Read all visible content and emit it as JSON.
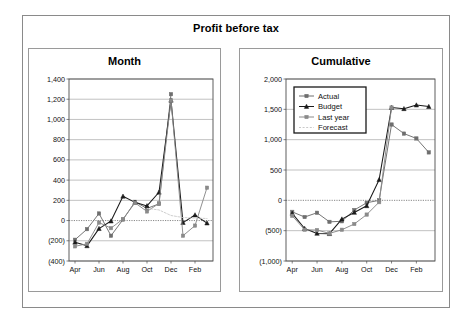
{
  "document": {
    "title": "Profit before tax"
  },
  "colors": {
    "page_background": "#ffffff",
    "frame_border": "#8a8a8a",
    "panel_border": "#9a9a9a",
    "plot_border": "#4d4d4d",
    "gridline": "#a8a8a8",
    "zero_line": "#7a7a7a",
    "actual": "#6e6e6e",
    "budget": "#1a1a1a",
    "last_year": "#8a8a8a",
    "forecast": "#c9c9c9",
    "legend_background": "#ffffff",
    "legend_border": "#1a1a1a",
    "text": "#111111"
  },
  "charts": [
    {
      "id": "month",
      "title": "Month",
      "axis": {
        "ylim": [
          -400,
          1400
        ],
        "ystep": 200,
        "yticks": [
          "1,400",
          "1,200",
          "1,000",
          "800",
          "600",
          "400",
          "200",
          "0",
          "(200)",
          "(400)"
        ],
        "ytick_values": [
          1400,
          1200,
          1000,
          800,
          600,
          400,
          200,
          0,
          -200,
          -400
        ],
        "xticks": [
          "Apr",
          "Jun",
          "Aug",
          "Oct",
          "Dec",
          "Feb"
        ],
        "xtick_indices": [
          0,
          2,
          4,
          6,
          8,
          10
        ]
      }
    },
    {
      "id": "cumulative",
      "title": "Cumulative",
      "axis": {
        "ylim": [
          -1000,
          2000
        ],
        "ystep": 500,
        "yticks": [
          "2,000",
          "1,500",
          "1,000",
          "500",
          "0",
          "(500)",
          "(1,000)"
        ],
        "ytick_values": [
          2000,
          1500,
          1000,
          500,
          0,
          -500,
          -1000
        ],
        "xticks": [
          "Apr",
          "Jun",
          "Aug",
          "Oct",
          "Dec",
          "Feb"
        ],
        "xtick_indices": [
          0,
          2,
          4,
          6,
          8,
          10
        ]
      }
    }
  ],
  "legend": {
    "position": "top-left-inside-cumulative",
    "items": [
      {
        "label": "Actual",
        "marker": "square",
        "color": "#6e6e6e"
      },
      {
        "label": "Budget",
        "marker": "triangle",
        "color": "#1a1a1a"
      },
      {
        "label": "Last year",
        "marker": "square",
        "color": "#8a8a8a"
      },
      {
        "label": "Forecast",
        "marker": "none",
        "color": "#c9c9c9"
      }
    ]
  },
  "chart_data": [
    {
      "type": "line",
      "id": "month",
      "title": "Month",
      "xlabel": "",
      "ylabel": "",
      "ylim": [
        -400,
        1400
      ],
      "grid": true,
      "categories": [
        "Apr",
        "May",
        "Jun",
        "Jul",
        "Aug",
        "Sep",
        "Oct",
        "Nov",
        "Dec",
        "Jan",
        "Feb",
        "Mar"
      ],
      "tick_labels": [
        "Apr",
        "Jun",
        "Aug",
        "Oct",
        "Dec",
        "Feb"
      ],
      "legend_position": "none",
      "series": [
        {
          "name": "Actual",
          "values": [
            -190,
            -85,
            70,
            -150,
            10,
            185,
            120,
            165,
            1250,
            null,
            null,
            null
          ]
        },
        {
          "name": "Budget",
          "values": [
            -215,
            -250,
            -80,
            -5,
            240,
            180,
            145,
            280,
            1190,
            -20,
            55,
            -25
          ]
        },
        {
          "name": "Last year",
          "values": [
            -255,
            -230,
            -20,
            -75,
            15,
            175,
            90,
            170,
            1190,
            -150,
            -50,
            325
          ]
        },
        {
          "name": "Forecast",
          "values": [
            null,
            null,
            null,
            null,
            null,
            null,
            120,
            105,
            50,
            30,
            25,
            20
          ]
        }
      ]
    },
    {
      "type": "line",
      "id": "cumulative",
      "title": "Cumulative",
      "xlabel": "",
      "ylabel": "",
      "ylim": [
        -1000,
        2000
      ],
      "grid": true,
      "categories": [
        "Apr",
        "May",
        "Jun",
        "Jul",
        "Aug",
        "Sep",
        "Oct",
        "Nov",
        "Dec",
        "Jan",
        "Feb",
        "Mar"
      ],
      "tick_labels": [
        "Apr",
        "Jun",
        "Aug",
        "Oct",
        "Dec",
        "Feb"
      ],
      "legend_position": "upper-left",
      "series": [
        {
          "name": "Actual",
          "values": [
            -190,
            -275,
            -205,
            -355,
            -345,
            -160,
            -40,
            0,
            1250,
            1100,
            1020,
            790
          ]
        },
        {
          "name": "Budget",
          "values": [
            -215,
            -465,
            -545,
            -550,
            -310,
            -200,
            -90,
            340,
            1530,
            1510,
            1570,
            1545
          ]
        },
        {
          "name": "Last year",
          "values": [
            -255,
            -485,
            -490,
            -545,
            -485,
            -390,
            -235,
            -30,
            1530,
            null,
            null,
            null
          ]
        },
        {
          "name": "Forecast",
          "values": [
            null,
            null,
            null,
            null,
            null,
            null,
            null,
            null,
            null,
            null,
            null,
            null
          ]
        }
      ]
    }
  ]
}
